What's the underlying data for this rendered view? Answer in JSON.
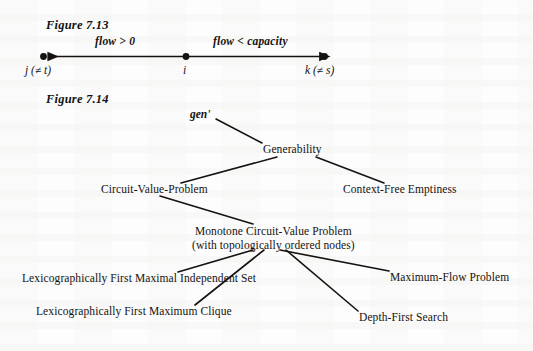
{
  "page": {
    "background_color": "#fdfdfd",
    "ink_color": "#15120f"
  },
  "figure_713": {
    "caption": "Figure 7.13",
    "left_edge_label": "j (≠ t)",
    "middle_node_label": "i",
    "right_edge_label": "k (≠ s)",
    "left_arc_label": "flow > 0",
    "right_arc_label": "flow < capacity"
  },
  "figure_714": {
    "caption": "Figure 7.14",
    "root_annotation": "gen'",
    "nodes": [
      {
        "id": "generability",
        "label": "Generability"
      },
      {
        "id": "circuit-value-problem",
        "label": "Circuit-Value-Problem"
      },
      {
        "id": "context-free-emptiness",
        "label": "Context-Free Emptiness"
      },
      {
        "id": "monotone-circuit-value-problem",
        "label_line1": "Monotone Circuit-Value Problem",
        "label_line2": "(with topologically ordered nodes)"
      },
      {
        "id": "lex-first-maximal-independent-set",
        "label": "Lexicographically First Maximal Independent Set"
      },
      {
        "id": "lex-first-maximum-clique",
        "label": "Lexicographically First Maximum Clique"
      },
      {
        "id": "maximum-flow-problem",
        "label": "Maximum-Flow Problem"
      },
      {
        "id": "depth-first-search",
        "label": "Depth-First Search"
      }
    ]
  }
}
